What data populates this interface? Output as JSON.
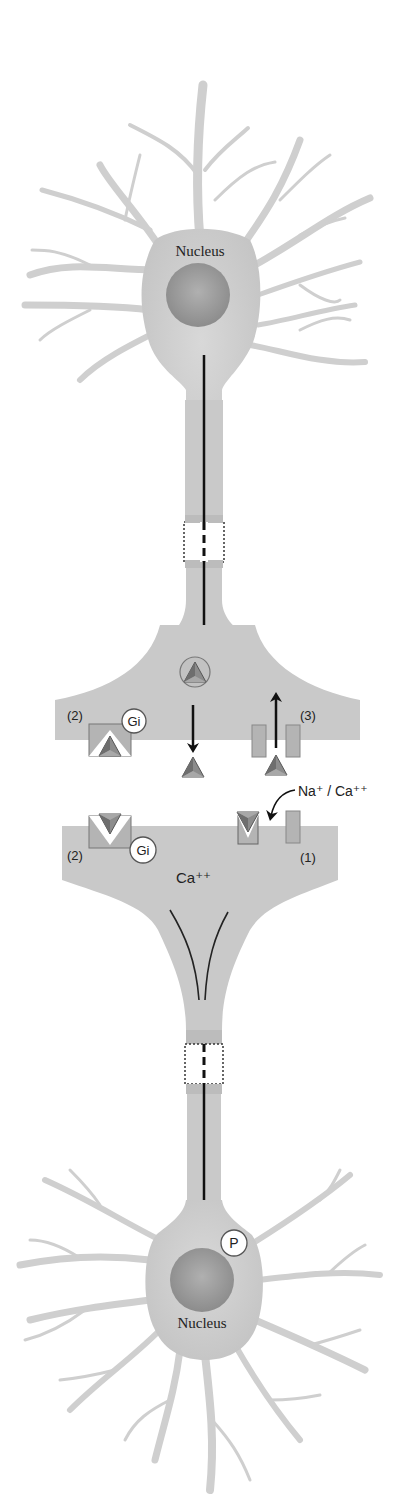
{
  "diagram": {
    "upper_neuron": {
      "nucleus_label": "Nucleus"
    },
    "synapse": {
      "presynaptic_labels": {
        "receptor_2": "(2)",
        "gi_protein": "Gi",
        "channel_3": "(3)"
      },
      "cleft_labels": {
        "ions": "Na⁺ / Ca⁺⁺"
      },
      "postsynaptic_labels": {
        "receptor_2": "(2)",
        "gi_protein": "Gi",
        "channel_1": "(1)",
        "calcium": "Ca⁺⁺"
      }
    },
    "lower_neuron": {
      "phospho_label": "P",
      "nucleus_label": "Nucleus"
    },
    "colors": {
      "cell_fill": "#c8c8c8",
      "cell_light": "#d9d9d9",
      "nucleus": "#9a9a9a",
      "arrow": "#111111",
      "ligand_dark": "#6e6e6e",
      "ligand_mid": "#8c8c8c",
      "receptor_fill": "#b4b4b4",
      "text": "#222222"
    }
  }
}
